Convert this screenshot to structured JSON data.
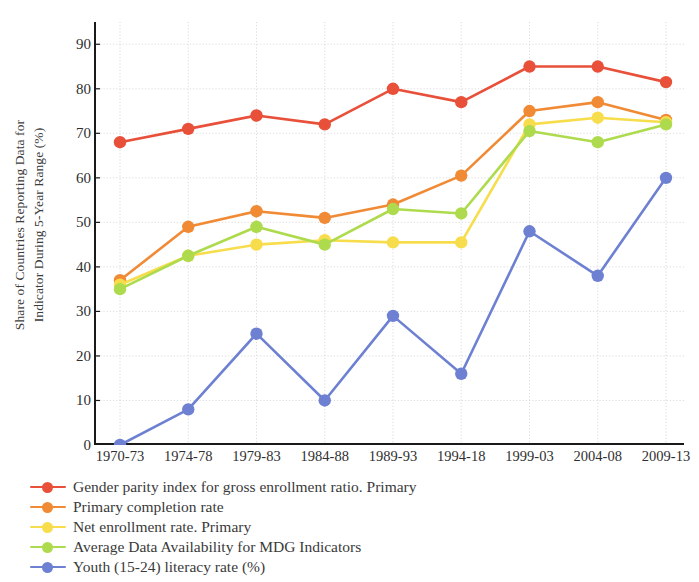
{
  "chart_data": {
    "type": "line",
    "title": "",
    "xlabel": "",
    "ylabel": "Share of Countries Reporting Data for Indicator During 5-Year Range (%)",
    "ylabel_line1": "Share of Countries Reporting Data for",
    "ylabel_line2": "Indicator During 5-Year Range (%)",
    "ylim": [
      0,
      95
    ],
    "yticks": [
      0,
      10,
      20,
      30,
      40,
      50,
      60,
      70,
      80,
      90
    ],
    "grid": true,
    "legend_position": "below",
    "categories": [
      "1970-73",
      "1974-78",
      "1979-83",
      "1984-88",
      "1989-93",
      "1994-18",
      "1999-03",
      "2004-08",
      "2009-13"
    ],
    "series": [
      {
        "name": "Gender parity index for gross enrollment ratio. Primary",
        "color": "#E8503A",
        "values": [
          68,
          71,
          74,
          72,
          80,
          77,
          85,
          85,
          81.5
        ]
      },
      {
        "name": "Primary completion rate",
        "color": "#F08A35",
        "values": [
          37,
          49,
          52.5,
          51,
          54,
          60.5,
          75,
          77,
          73
        ]
      },
      {
        "name": "Net enrollment rate. Primary",
        "color": "#F7DD4C",
        "values": [
          36,
          42.5,
          45,
          46,
          45.5,
          45.5,
          72,
          73.5,
          72.5
        ]
      },
      {
        "name": "Average Data Availability for MDG Indicators",
        "color": "#AEDB4E",
        "values": [
          35,
          42.5,
          49,
          45,
          53,
          52,
          70.5,
          68,
          72
        ]
      },
      {
        "name": "Youth (15-24) literacy rate (%)",
        "color": "#6D80D2",
        "values": [
          0,
          8,
          25,
          10,
          29,
          16,
          48,
          38,
          60
        ]
      }
    ]
  },
  "axis": {
    "spine_color": "#1a1a1a",
    "grid_color": "#cfcfd6"
  }
}
